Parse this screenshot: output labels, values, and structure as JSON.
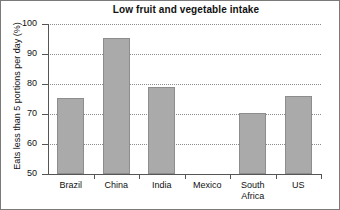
{
  "chart_data": {
    "type": "bar",
    "title": "Low fruit and vegetable intake",
    "xlabel": "",
    "ylabel": "Eats less than 5 portions per day (%)",
    "categories": [
      "Brazil",
      "China",
      "India",
      "Mexico",
      "South\nAfrica",
      "US"
    ],
    "values": [
      75.5,
      95.5,
      79,
      null,
      70.5,
      76
    ],
    "ylim": [
      50,
      100
    ],
    "yticks": [
      50,
      60,
      70,
      80,
      90,
      100
    ],
    "ytick_labels": [
      "50",
      "60",
      "70",
      "80",
      "90",
      "100"
    ],
    "grid": true,
    "grid_axis": "y",
    "grid_style": "dotted",
    "legend": null,
    "bar_color": "#aaaaaa",
    "bar_edge_color": "#8d8d8d",
    "axis_color": "#555555",
    "background": "#ffffff"
  },
  "axis": {
    "y_title": "Eats less than 5 portions per day (%)",
    "ticks": [
      {
        "label": "100",
        "value": 100
      },
      {
        "label": "90",
        "value": 90
      },
      {
        "label": "80",
        "value": 80
      },
      {
        "label": "70",
        "value": 70
      },
      {
        "label": "60",
        "value": 60
      },
      {
        "label": "50",
        "value": 50
      }
    ]
  },
  "title": {
    "text": "Low fruit and vegetable intake"
  },
  "categories": [
    {
      "label": "Brazil"
    },
    {
      "label": "China"
    },
    {
      "label": "India"
    },
    {
      "label": "Mexico"
    },
    {
      "label": "South\nAfrica"
    },
    {
      "label": "US"
    }
  ]
}
